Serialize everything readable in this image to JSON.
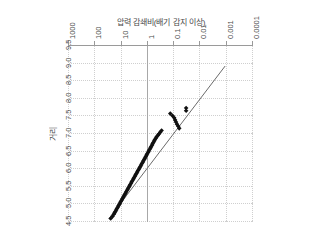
{
  "chart_data": {
    "type": "scatter",
    "title": "",
    "xlabel": "거리",
    "ylabel": "압력 감쇄비(배기 감지 이상)",
    "xlim": [
      4.5,
      9.5
    ],
    "ylim": [
      0.0001,
      1000
    ],
    "yscale": "log",
    "grid": true,
    "legend": false,
    "orientation": "rotated-180",
    "xticks": [
      "4.5",
      "5.0",
      "5.5",
      "6.0",
      "6.5",
      "7.0",
      "7.5",
      "8.0",
      "8.5",
      "9.0",
      "9.5"
    ],
    "xtick_values": [
      4.5,
      5.0,
      5.5,
      6.0,
      6.5,
      7.0,
      7.5,
      8.0,
      8.5,
      9.0,
      9.5
    ],
    "yticks": [
      "0.0001",
      "0.001",
      "0.01",
      "0.1",
      "1",
      "10",
      "100",
      "1000"
    ],
    "ytick_values": [
      0.0001,
      0.001,
      0.01,
      0.1,
      1,
      10,
      100,
      1000
    ],
    "series": [
      {
        "name": "관측값",
        "marker": "diamond",
        "color": "#111111",
        "x": [
          7.74,
          7.66,
          7.58,
          7.52,
          7.46,
          7.4,
          7.34,
          7.28,
          7.22,
          7.16,
          7.1,
          7.05,
          7.0,
          6.96,
          6.92,
          6.88,
          6.84,
          6.8,
          6.76,
          6.72,
          6.68,
          6.64,
          6.6,
          6.56,
          6.52,
          6.48,
          6.44,
          6.4,
          6.36,
          6.32,
          6.28,
          6.24,
          6.2,
          6.16,
          6.12,
          6.08,
          6.04,
          6.0,
          5.96,
          5.92,
          5.88,
          5.84,
          5.8,
          5.76,
          5.72,
          5.68,
          5.64,
          5.6,
          5.56,
          5.52,
          5.48,
          5.44,
          5.4,
          5.36,
          5.32,
          5.28,
          5.24,
          5.2,
          5.16,
          5.12,
          5.08,
          5.04,
          5.0,
          4.96,
          4.92,
          4.88,
          4.84,
          4.8,
          4.76,
          4.72,
          4.66,
          4.6
        ],
        "y": [
          0.035,
          0.035,
          0.14,
          0.115,
          0.1,
          0.092,
          0.085,
          0.078,
          0.07,
          0.064,
          0.3,
          0.34,
          0.38,
          0.42,
          0.46,
          0.5,
          0.54,
          0.58,
          0.62,
          0.66,
          0.7,
          0.75,
          0.8,
          0.86,
          0.92,
          0.98,
          1.05,
          1.12,
          1.2,
          1.28,
          1.37,
          1.47,
          1.57,
          1.68,
          1.8,
          1.93,
          2.06,
          2.21,
          2.37,
          2.54,
          2.72,
          2.91,
          3.12,
          3.34,
          3.58,
          3.83,
          4.1,
          4.39,
          4.7,
          5.03,
          5.39,
          5.77,
          6.18,
          6.62,
          7.09,
          7.59,
          8.13,
          8.7,
          9.32,
          9.98,
          10.7,
          11.4,
          12.2,
          13.1,
          14.0,
          15.0,
          16.1,
          17.2,
          18.4,
          19.7,
          22.0,
          26.0
        ]
      }
    ],
    "trend_line": {
      "name": "추세선",
      "color": "#6b6b6b",
      "x": [
        8.93,
        4.6
      ],
      "y": [
        0.00115,
        30.0
      ]
    }
  }
}
